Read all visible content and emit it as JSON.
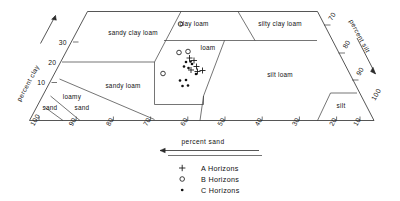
{
  "chart_data": {
    "type": "scatter",
    "title": "",
    "diagram_kind": "soil-texture-triangle",
    "axes": {
      "clay": {
        "label": "percent clay",
        "ticks": [
          "10",
          "20",
          "30"
        ],
        "direction": "increasing-upward",
        "arrow": "up-right"
      },
      "silt": {
        "label": "percent silt",
        "ticks": [
          "70",
          "80",
          "90",
          "100"
        ],
        "direction": "increasing-downward",
        "arrow": "down-right"
      },
      "sand": {
        "label": "percent sand",
        "ticks": [
          "100",
          "90",
          "80",
          "70",
          "60",
          "50",
          "40",
          "30",
          "20",
          "10"
        ],
        "direction": "increasing-leftward",
        "arrow": "left"
      }
    },
    "regions": [
      {
        "name": "sandy clay loam"
      },
      {
        "name": "clay loam"
      },
      {
        "name": "silty clay loam"
      },
      {
        "name": "loam"
      },
      {
        "name": "sandy loam"
      },
      {
        "name": "silt loam"
      },
      {
        "name": "loamy sand"
      },
      {
        "name": "sand"
      },
      {
        "name": "silt"
      }
    ],
    "series": [
      {
        "name": "A Horizons",
        "marker": "plus",
        "points": [
          {
            "x": 194.0,
            "y": 60.5
          },
          {
            "x": 196.5,
            "y": 66.5
          },
          {
            "x": 202.5,
            "y": 70.5
          },
          {
            "x": 189.5,
            "y": 58.0
          },
          {
            "x": 191.0,
            "y": 70.0
          },
          {
            "x": 197.5,
            "y": 71.5
          }
        ]
      },
      {
        "name": "B Horizons",
        "marker": "circle",
        "points": [
          {
            "x": 179.0,
            "y": 52.5
          },
          {
            "x": 188.0,
            "y": 51.5
          },
          {
            "x": 180.5,
            "y": 24.0
          },
          {
            "x": 163.0,
            "y": 73.5
          }
        ]
      },
      {
        "name": "C Horizons",
        "marker": "dot",
        "points": [
          {
            "x": 186.0,
            "y": 62.0
          },
          {
            "x": 190.5,
            "y": 61.5
          },
          {
            "x": 184.0,
            "y": 66.5
          },
          {
            "x": 188.5,
            "y": 68.0
          },
          {
            "x": 196.0,
            "y": 74.0
          },
          {
            "x": 180.0,
            "y": 80.5
          },
          {
            "x": 186.0,
            "y": 80.0
          },
          {
            "x": 182.5,
            "y": 86.0
          },
          {
            "x": 188.0,
            "y": 85.5
          },
          {
            "x": 192.0,
            "y": 64.0
          }
        ]
      }
    ]
  },
  "regions": {
    "sandy_clay_loam": "sandy clay loam",
    "clay_loam": "clay  loam",
    "silty_clay_loam": "silty clay loam",
    "loam": "loam",
    "sandy_loam": "sandy  loam",
    "silt_loam": "silt loam",
    "loamy": "loamy",
    "loamy_sand": "sand",
    "sand": "sand",
    "silt": "silt"
  },
  "axis_titles": {
    "clay": "percent clay",
    "silt": "percent silt",
    "sand": "percent sand"
  },
  "clay_ticks": [
    "30",
    "20",
    "10"
  ],
  "silt_ticks": [
    "70",
    "80",
    "90",
    "100"
  ],
  "sand_ticks": [
    "100",
    "90",
    "80",
    "70",
    "60",
    "50",
    "40",
    "30",
    "20",
    "10"
  ],
  "legend": {
    "items": [
      {
        "marker": "plus-marker",
        "label": "A  Horizons"
      },
      {
        "marker": "circle-marker",
        "label": "B  Horizons"
      },
      {
        "marker": "dot-marker",
        "label": "C  Horizons"
      }
    ]
  },
  "colors": {
    "line": "#2b2b2b",
    "text": "#111111",
    "background": "#ffffff"
  }
}
